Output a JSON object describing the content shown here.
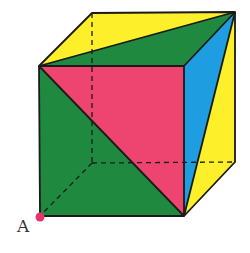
{
  "figure": {
    "point_label": "A",
    "colors": {
      "green": "#1f8a3f",
      "pink": "#ee4470",
      "yellow": "#fdf02a",
      "blue": "#1e9de0",
      "edge": "#1a1a1a",
      "point": "#e8336a"
    },
    "vertices": {
      "front_top_left": [
        39,
        66
      ],
      "front_top_right": [
        184,
        66
      ],
      "front_bottom_left_A": [
        40,
        216
      ],
      "front_bottom_right": [
        184,
        216
      ],
      "back_top_left": [
        92,
        13
      ],
      "back_top_right": [
        235,
        12
      ],
      "back_bottom_right": [
        235,
        162
      ],
      "back_bottom_left": [
        92,
        163
      ]
    },
    "faces": [
      {
        "name": "top-yellow-triangle",
        "color": "yellow"
      },
      {
        "name": "top-green-triangle",
        "color": "green"
      },
      {
        "name": "front-pink-triangle",
        "color": "pink"
      },
      {
        "name": "front-green-triangle",
        "color": "green"
      },
      {
        "name": "right-blue-triangle",
        "color": "blue"
      },
      {
        "name": "right-yellow-triangle",
        "color": "yellow"
      }
    ],
    "hidden_edges": [
      "back_top_left-back_bottom_left",
      "back_bottom_left-back_bottom_right",
      "back_bottom_left-front_bottom_left_A"
    ]
  }
}
